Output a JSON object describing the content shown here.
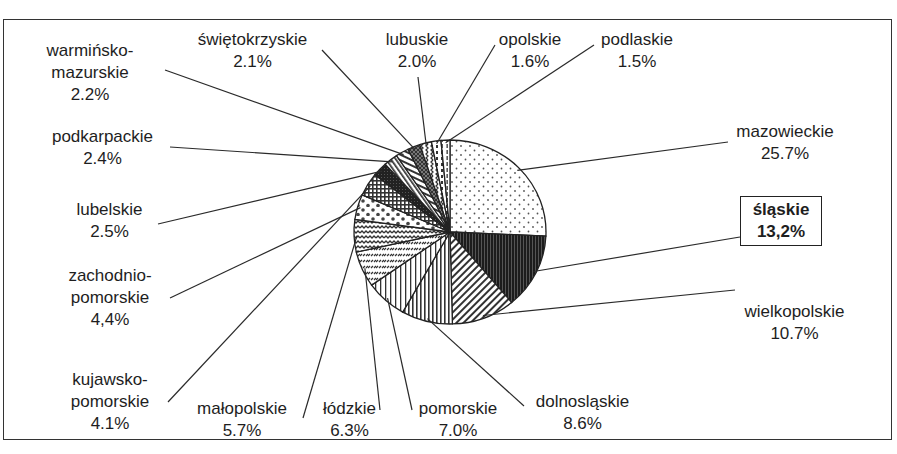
{
  "chart_data": {
    "type": "pie",
    "title": "",
    "unit": "%",
    "highlighted": "śląskie",
    "slices": [
      {
        "name": "mazowieckie",
        "value": 25.7,
        "display": "25.7%",
        "pattern": "dots"
      },
      {
        "name": "śląskie",
        "value": 13.2,
        "display": "13,2%",
        "pattern": "dark-vertical",
        "highlighted": true
      },
      {
        "name": "wielkopolskie",
        "value": 10.7,
        "display": "10.7%",
        "pattern": "diagonal-down"
      },
      {
        "name": "dolnosląskie",
        "value": 8.6,
        "display": "8.6%",
        "pattern": "vertical-lines"
      },
      {
        "name": "pomorskie",
        "value": 7.0,
        "display": "7.0%",
        "pattern": "vertical-lines-fine"
      },
      {
        "name": "łódzkie",
        "value": 6.3,
        "display": "6.3%",
        "pattern": "dashed-diagonal"
      },
      {
        "name": "małopolskie",
        "value": 5.7,
        "display": "5.7%",
        "pattern": "zigzag"
      },
      {
        "name": "zachodnio-pomorskie",
        "value": 4.4,
        "display": "4,4%",
        "pattern": "dots-large"
      },
      {
        "name": "kujawsko-pomorskie",
        "value": 4.1,
        "display": "4.1%",
        "pattern": "grid"
      },
      {
        "name": "lubelskie",
        "value": 2.5,
        "display": "2.5%",
        "pattern": "solid-dark"
      },
      {
        "name": "podkarpackie",
        "value": 2.4,
        "display": "2.4%",
        "pattern": "diagonal-up"
      },
      {
        "name": "warmińsko-mazurskie",
        "value": 2.2,
        "display": "2.2%",
        "pattern": "horizontal-lines"
      },
      {
        "name": "świętokrzyskie",
        "value": 2.1,
        "display": "2.1%",
        "pattern": "crosshatch"
      },
      {
        "name": "lubuskie",
        "value": 2.0,
        "display": "2.0%",
        "pattern": "zigzag-vertical"
      },
      {
        "name": "opolskie",
        "value": 1.6,
        "display": "1.6%",
        "pattern": "dashes"
      },
      {
        "name": "podlaskie",
        "value": 1.5,
        "display": "1.5%",
        "pattern": "vertical-dashes"
      }
    ],
    "legend": "none (leader-line labels)"
  },
  "labels": {
    "mazowieckie": {
      "l1": "mazowieckie",
      "l2": "25.7%"
    },
    "slaskie": {
      "l1": "śląskie",
      "l2": "13,2%"
    },
    "wielkopolskie": {
      "l1": "wielkopolskie",
      "l2": "10.7%"
    },
    "dolnoslaskie": {
      "l1": "dolnosląskie",
      "l2": "8.6%"
    },
    "pomorskie": {
      "l1": "pomorskie",
      "l2": "7.0%"
    },
    "lodzkie": {
      "l1": "łódzkie",
      "l2": "6.3%"
    },
    "malopolskie": {
      "l1": "małopolskie",
      "l2": "5.7%"
    },
    "kujawsko": {
      "l1": "kujawsko-",
      "l2": "pomorskie",
      "l3": "4.1%"
    },
    "zachodnio": {
      "l1": "zachodnio-",
      "l2": "pomorskie",
      "l3": "4,4%"
    },
    "lubelskie": {
      "l1": "lubelskie",
      "l2": "2.5%"
    },
    "podkarpackie": {
      "l1": "podkarpackie",
      "l2": "2.4%"
    },
    "warminsko": {
      "l1": "warmińsko-",
      "l2": "mazurskie",
      "l3": "2.2%"
    },
    "swietokrzyskie": {
      "l1": "świętokrzyskie",
      "l2": "2.1%"
    },
    "lubuskie": {
      "l1": "lubuskie",
      "l2": "2.0%"
    },
    "opolskie": {
      "l1": "opolskie",
      "l2": "1.6%"
    },
    "podlaskie": {
      "l1": "podlaskie",
      "l2": "1.5%"
    }
  }
}
